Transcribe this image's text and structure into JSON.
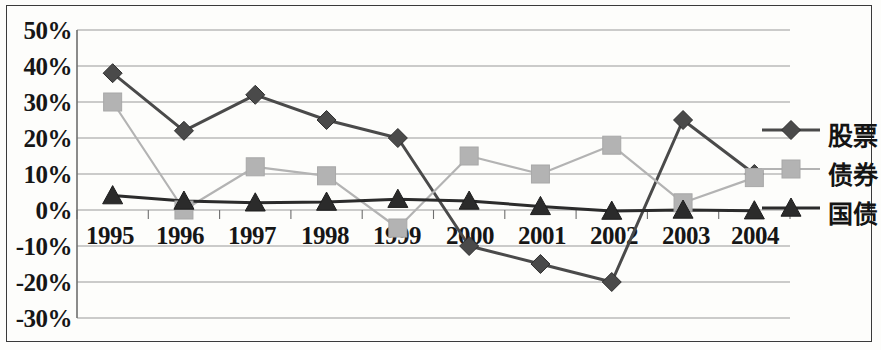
{
  "chart_data": {
    "type": "line",
    "title": "",
    "xlabel": "",
    "ylabel": "",
    "categories": [
      "1995",
      "1996",
      "1997",
      "1998",
      "1999",
      "2000",
      "2001",
      "2002",
      "2003",
      "2004"
    ],
    "ylim": [
      -30,
      50
    ],
    "y_ticks": [
      50,
      40,
      30,
      20,
      10,
      0,
      -10,
      -20,
      -30
    ],
    "y_tick_labels": [
      "50%",
      "40%",
      "30%",
      "20%",
      "10%",
      "0%",
      "-10%",
      "-20%",
      "-30%"
    ],
    "grid": true,
    "legend_position": "right",
    "series": [
      {
        "name": "股票",
        "marker": "diamond",
        "color": "#4a4a4a",
        "values": [
          38,
          22,
          32,
          25,
          20,
          -10,
          -15,
          -20,
          25,
          10
        ]
      },
      {
        "name": "债券",
        "marker": "square",
        "color": "#b3b3b3",
        "values": [
          30,
          0,
          12,
          9.5,
          -5,
          15,
          10,
          18,
          2,
          9
        ]
      },
      {
        "name": "国债",
        "marker": "triangle",
        "color": "#2b2b2b",
        "values": [
          4,
          2.5,
          2,
          2.2,
          3,
          2.5,
          1,
          -0.3,
          0,
          -0.2
        ]
      }
    ]
  },
  "axis": {
    "y_labels": [
      "50%",
      "40%",
      "30%",
      "20%",
      "10%",
      "0%",
      "-10%",
      "-20%",
      "-30%"
    ],
    "x_labels": [
      "1995",
      "1996",
      "1997",
      "1998",
      "1999",
      "2000",
      "2001",
      "2002",
      "2003",
      "2004"
    ]
  },
  "legend": {
    "items": [
      {
        "label": "股票",
        "marker": "diamond-marker",
        "color": "#4a4a4a"
      },
      {
        "label": "债券",
        "marker": "square-marker",
        "color": "#b3b3b3"
      },
      {
        "label": "国债",
        "marker": "triangle-marker",
        "color": "#2b2b2b"
      }
    ]
  },
  "colors": {
    "stocks": "#4a4a4a",
    "bonds": "#b3b3b3",
    "treasury": "#2b2b2b",
    "grid": "#9a9a9a",
    "axis": "#6e6e6e",
    "border": "#3a3a3a"
  }
}
